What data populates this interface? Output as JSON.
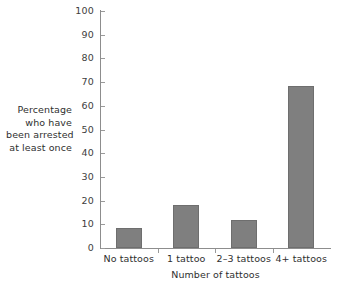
{
  "chart_data": {
    "type": "bar",
    "title": "",
    "subtitle": "",
    "xlabel": "Number of tattoos",
    "ylabel": "Percentage who have been arrested at least once",
    "ylabel_lines": [
      "Percentage",
      "who have",
      "been arrested",
      "at least once"
    ],
    "categories": [
      "No tattoos",
      "1 tattoo",
      "2–3 tattoos",
      "4+ tattoos"
    ],
    "values": [
      8.5,
      18,
      12,
      68.5
    ],
    "ylim": [
      0,
      100
    ],
    "ytick_step": 10,
    "ytick_labels": [
      "0",
      "10",
      "20",
      "30",
      "40",
      "50",
      "60",
      "70",
      "80",
      "90",
      "100"
    ],
    "grid": false,
    "legend": false,
    "legend_position": "none",
    "bar_color": "#7f7f7f",
    "axis_color": "#8d8d8d",
    "text_color": "#2f2f2f",
    "background_color": "#ffffff"
  }
}
